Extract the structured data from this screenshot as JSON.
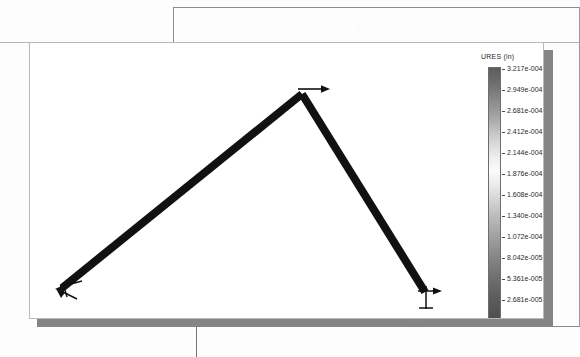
{
  "figure": {
    "type": "fea-displacement-plot",
    "legend": {
      "title": "URES (in)",
      "unit": "in",
      "quantity": "URES",
      "colormap": "grayscale",
      "max_value": "3.217e-004",
      "min_value": "3.937e-032",
      "ticks": [
        "3.217e-004",
        "2.949e-004",
        "2.681e-004",
        "2.412e-004",
        "2.144e-004",
        "1.876e-004",
        "1.608e-004",
        "1.340e-004",
        "1.072e-004",
        "8.042e-005",
        "5.361e-005",
        "2.681e-005",
        "3.937e-032"
      ]
    },
    "model": {
      "name": "two-bar-truss",
      "members": [
        {
          "name": "left-member",
          "x1": 32,
          "y1": 245,
          "x2": 272,
          "y2": 51
        },
        {
          "name": "right-member",
          "x1": 272,
          "y1": 51,
          "x2": 395,
          "y2": 249
        }
      ],
      "nodes": [
        {
          "name": "left-support-node",
          "x": 32,
          "y": 245
        },
        {
          "name": "apex-node",
          "x": 272,
          "y": 51
        },
        {
          "name": "right-support-node",
          "x": 395,
          "y": 249
        }
      ],
      "annotations": [
        {
          "name": "apex-load-arrow",
          "direction": "right",
          "x": 272,
          "y": 51,
          "length": 28
        },
        {
          "name": "left-restraint-marker",
          "x": 32,
          "y": 245
        },
        {
          "name": "right-restraint-marker",
          "x": 395,
          "y": 249
        }
      ]
    },
    "colors": {
      "member": "#111111",
      "panel_background": "#ffffff",
      "panel_border": "#b9b9b9",
      "panel_shadow": "#858585",
      "page_background": "#fdfdfd",
      "document_rule": "#8c8c8c",
      "legend_text": "#2b2b2b"
    }
  }
}
